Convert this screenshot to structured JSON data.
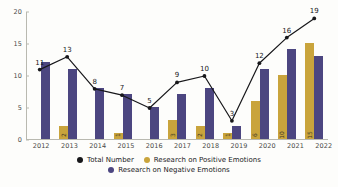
{
  "chart_data": {
    "type": "bar",
    "title": "",
    "subtitle": "",
    "xlabel": "",
    "ylabel": "",
    "categories": [
      "2012",
      "2013",
      "2014",
      "2015",
      "2016",
      "2017",
      "2018",
      "2019",
      "2020",
      "2021",
      "2022"
    ],
    "ylim": [
      0,
      20
    ],
    "yticks": [
      "0",
      "5",
      "10",
      "15",
      "20"
    ],
    "ytick_values": [
      0,
      5,
      10,
      15,
      20
    ],
    "grid": false,
    "legend_position": "bottom",
    "series": [
      {
        "name": "Total Number",
        "type": "line",
        "color": "#17171a",
        "values": [
          11,
          13,
          8,
          7,
          5,
          9,
          10,
          3,
          12,
          16,
          19
        ],
        "labels": [
          "11",
          "13",
          "8",
          "7",
          "5",
          "9",
          "10",
          "3",
          "12",
          "16",
          "19"
        ]
      },
      {
        "name": "Research on Positive Emotions",
        "type": "bar",
        "color": "#c9a43c",
        "values": [
          0,
          2,
          0,
          1,
          0,
          3,
          2,
          1,
          6,
          10,
          15
        ],
        "labels": [
          "",
          "2",
          "",
          "1",
          "",
          "3",
          "2",
          "1",
          "6",
          "10",
          "15"
        ]
      },
      {
        "name": "Research on Negative Emotions",
        "type": "bar",
        "color": "#4c4680",
        "values": [
          12,
          11,
          8,
          7,
          5,
          7,
          8,
          2,
          11,
          14,
          13
        ],
        "labels": [
          "",
          "",
          "",
          "",
          "",
          "",
          "",
          "",
          "",
          "",
          ""
        ]
      }
    ]
  },
  "legend": {
    "items": [
      {
        "label": "Total Number",
        "color": "#17171a"
      },
      {
        "label": "Research on Positive Emotions",
        "color": "#c9a43c"
      },
      {
        "label": "Research on Negative Emotions",
        "color": "#4c4680"
      }
    ]
  }
}
